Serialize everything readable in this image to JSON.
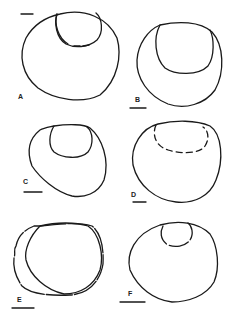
{
  "figure": {
    "panels": [
      {
        "label": "A",
        "scale_bar": "top-left"
      },
      {
        "label": "B",
        "scale_bar": "bottom-left"
      },
      {
        "label": "C",
        "scale_bar": "bottom-left"
      },
      {
        "label": "D",
        "scale_bar": "bottom-left"
      },
      {
        "label": "E",
        "scale_bar": "bottom-left"
      },
      {
        "label": "F",
        "scale_bar": "bottom-left"
      }
    ],
    "line_color": "#1a1a1a",
    "background": "#ffffff"
  }
}
